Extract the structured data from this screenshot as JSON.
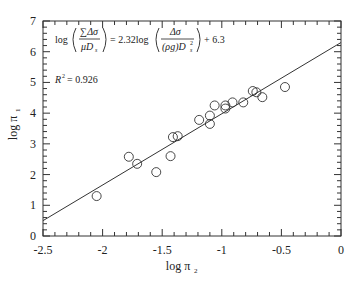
{
  "chart_data": {
    "type": "scatter",
    "title": "",
    "xlabel": "log π",
    "xlabel_sub": "2",
    "ylabel": "log π",
    "ylabel_sub": "1",
    "xlim": [
      -2.5,
      0
    ],
    "ylim": [
      0,
      7
    ],
    "x_major_ticks": [
      -2.5,
      -2,
      -1.5,
      -1,
      -0.5,
      0
    ],
    "x_tick_labels": [
      "-2.5",
      "-2",
      "-1.5",
      "-1",
      "-0.5",
      "0"
    ],
    "x_minor_step": 0.1,
    "y_major_ticks": [
      0,
      1,
      2,
      3,
      4,
      5,
      6,
      7
    ],
    "y_tick_labels": [
      "0",
      "1",
      "2",
      "3",
      "4",
      "5",
      "6",
      "7"
    ],
    "y_minor_step": 0.2,
    "grid": false,
    "legend": null,
    "points": [
      {
        "x": -2.05,
        "y": 1.3
      },
      {
        "x": -1.78,
        "y": 2.58
      },
      {
        "x": -1.71,
        "y": 2.35
      },
      {
        "x": -1.55,
        "y": 2.08
      },
      {
        "x": -1.43,
        "y": 2.6
      },
      {
        "x": -1.41,
        "y": 3.22
      },
      {
        "x": -1.37,
        "y": 3.25
      },
      {
        "x": -1.19,
        "y": 3.78
      },
      {
        "x": -1.1,
        "y": 3.65
      },
      {
        "x": -1.1,
        "y": 3.92
      },
      {
        "x": -1.06,
        "y": 4.25
      },
      {
        "x": -0.97,
        "y": 4.15
      },
      {
        "x": -0.97,
        "y": 4.25
      },
      {
        "x": -0.91,
        "y": 4.35
      },
      {
        "x": -0.82,
        "y": 4.35
      },
      {
        "x": -0.74,
        "y": 4.72
      },
      {
        "x": -0.71,
        "y": 4.68
      },
      {
        "x": -0.66,
        "y": 4.52
      },
      {
        "x": -0.47,
        "y": 4.85
      }
    ],
    "fit_line": {
      "slope": 2.32,
      "intercept": 6.3
    },
    "annotations": {
      "equation_log": "log",
      "equation_num": "∑Δσ",
      "equation_den": "μD",
      "equation_den_sub": "s",
      "equation_eq": "= 2.32log",
      "equation_num2": "Δσ",
      "equation_den2": "(ρg)D",
      "equation_den2_sup": "2",
      "equation_den2_sub": "s",
      "equation_const": "+ 6.3",
      "r2_label": "R",
      "r2_sup": "2",
      "r2_value": "= 0.926"
    }
  }
}
